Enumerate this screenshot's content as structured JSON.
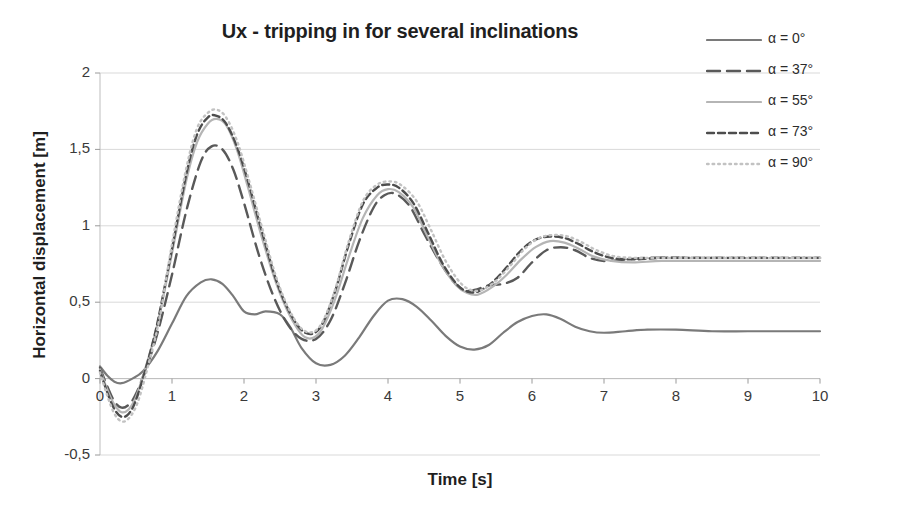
{
  "chart_data": {
    "type": "line",
    "title": "Ux - tripping in for several inclinations",
    "xlabel": "Time [s]",
    "ylabel": "Horizontal displacement [m]",
    "xlim": [
      0,
      10
    ],
    "ylim": [
      -0.5,
      2
    ],
    "xticks": [
      "0",
      "1",
      "2",
      "3",
      "4",
      "5",
      "6",
      "7",
      "8",
      "9",
      "10"
    ],
    "xtick_values": [
      0,
      1,
      2,
      3,
      4,
      5,
      6,
      7,
      8,
      9,
      10
    ],
    "yticks": [
      "-0,5",
      "0",
      "0,5",
      "1",
      "1,5",
      "2"
    ],
    "ytick_values": [
      -0.5,
      0,
      0.5,
      1,
      1.5,
      2
    ],
    "grid": "horizontal",
    "legend_position": "right",
    "decimal_separator": ",",
    "series": [
      {
        "name": "α = 0°",
        "style": "solid",
        "color": "#7a7a7a",
        "width": 2.2,
        "dash": "none",
        "x": [
          0,
          0.1,
          0.2,
          0.3,
          0.45,
          0.6,
          0.8,
          1.0,
          1.2,
          1.4,
          1.55,
          1.7,
          1.85,
          2.0,
          2.15,
          2.3,
          2.5,
          2.65,
          2.8,
          3.0,
          3.2,
          3.4,
          3.6,
          3.8,
          4.0,
          4.2,
          4.4,
          4.6,
          4.8,
          5.0,
          5.2,
          5.4,
          5.6,
          5.8,
          6.0,
          6.2,
          6.4,
          6.6,
          6.8,
          7.0,
          7.3,
          7.6,
          8.0,
          8.5,
          9.0,
          9.5,
          10
        ],
        "y": [
          0.08,
          0.02,
          -0.02,
          -0.03,
          0.0,
          0.05,
          0.18,
          0.36,
          0.54,
          0.63,
          0.65,
          0.62,
          0.54,
          0.44,
          0.42,
          0.44,
          0.42,
          0.33,
          0.2,
          0.1,
          0.09,
          0.15,
          0.27,
          0.41,
          0.51,
          0.52,
          0.47,
          0.38,
          0.28,
          0.21,
          0.19,
          0.22,
          0.3,
          0.37,
          0.41,
          0.42,
          0.39,
          0.34,
          0.31,
          0.3,
          0.31,
          0.32,
          0.32,
          0.31,
          0.31,
          0.31,
          0.31
        ]
      },
      {
        "name": "α = 37°",
        "style": "long-dash",
        "color": "#595959",
        "width": 2.4,
        "dash": "13 7",
        "x": [
          0,
          0.1,
          0.2,
          0.3,
          0.4,
          0.5,
          0.65,
          0.8,
          1.0,
          1.2,
          1.4,
          1.55,
          1.7,
          1.85,
          2.0,
          2.2,
          2.4,
          2.6,
          2.8,
          3.0,
          3.2,
          3.4,
          3.6,
          3.8,
          3.95,
          4.1,
          4.3,
          4.5,
          4.7,
          4.9,
          5.05,
          5.2,
          5.4,
          5.6,
          5.8,
          6.0,
          6.2,
          6.4,
          6.6,
          6.8,
          7.0,
          7.3,
          7.6,
          8.0,
          8.5,
          9.0,
          9.5,
          10
        ],
        "y": [
          0.07,
          -0.05,
          -0.15,
          -0.19,
          -0.17,
          -0.1,
          0.08,
          0.3,
          0.68,
          1.1,
          1.42,
          1.52,
          1.5,
          1.37,
          1.15,
          0.82,
          0.55,
          0.36,
          0.26,
          0.26,
          0.38,
          0.62,
          0.9,
          1.12,
          1.2,
          1.21,
          1.13,
          0.95,
          0.78,
          0.64,
          0.58,
          0.58,
          0.61,
          0.62,
          0.66,
          0.76,
          0.84,
          0.86,
          0.84,
          0.79,
          0.77,
          0.78,
          0.79,
          0.79,
          0.79,
          0.79,
          0.79,
          0.79
        ]
      },
      {
        "name": "α = 55°",
        "style": "solid-light",
        "color": "#b5b5b5",
        "width": 2.2,
        "dash": "none",
        "x": [
          0,
          0.1,
          0.2,
          0.3,
          0.4,
          0.5,
          0.65,
          0.8,
          1.0,
          1.2,
          1.35,
          1.5,
          1.62,
          1.75,
          1.9,
          2.05,
          2.25,
          2.45,
          2.65,
          2.85,
          3.05,
          3.25,
          3.45,
          3.65,
          3.85,
          4.0,
          4.15,
          4.35,
          4.55,
          4.75,
          4.95,
          5.1,
          5.25,
          5.45,
          5.65,
          5.85,
          6.05,
          6.25,
          6.45,
          6.65,
          6.85,
          7.1,
          7.4,
          7.8,
          8.3,
          8.9,
          9.5,
          10
        ],
        "y": [
          0.06,
          -0.07,
          -0.17,
          -0.22,
          -0.2,
          -0.12,
          0.1,
          0.36,
          0.82,
          1.3,
          1.55,
          1.67,
          1.7,
          1.66,
          1.5,
          1.26,
          0.92,
          0.62,
          0.4,
          0.27,
          0.3,
          0.5,
          0.79,
          1.05,
          1.2,
          1.24,
          1.22,
          1.12,
          0.93,
          0.74,
          0.61,
          0.56,
          0.55,
          0.6,
          0.68,
          0.78,
          0.86,
          0.9,
          0.89,
          0.85,
          0.8,
          0.77,
          0.76,
          0.77,
          0.77,
          0.77,
          0.77,
          0.77
        ]
      },
      {
        "name": "α = 73°",
        "style": "short-dash",
        "color": "#4d4d4d",
        "width": 2.4,
        "dash": "7 4",
        "x": [
          0,
          0.1,
          0.2,
          0.3,
          0.4,
          0.5,
          0.65,
          0.8,
          1.0,
          1.2,
          1.35,
          1.5,
          1.62,
          1.75,
          1.9,
          2.05,
          2.25,
          2.45,
          2.65,
          2.85,
          3.05,
          3.25,
          3.45,
          3.65,
          3.85,
          4.0,
          4.15,
          4.35,
          4.55,
          4.75,
          4.95,
          5.1,
          5.25,
          5.45,
          5.65,
          5.85,
          6.05,
          6.25,
          6.45,
          6.65,
          6.85,
          7.1,
          7.4,
          7.8,
          8.3,
          8.9,
          9.5,
          10
        ],
        "y": [
          0.05,
          -0.09,
          -0.2,
          -0.25,
          -0.23,
          -0.14,
          0.09,
          0.37,
          0.85,
          1.34,
          1.6,
          1.71,
          1.72,
          1.67,
          1.52,
          1.3,
          0.96,
          0.64,
          0.42,
          0.3,
          0.33,
          0.55,
          0.87,
          1.14,
          1.25,
          1.27,
          1.25,
          1.15,
          0.96,
          0.76,
          0.62,
          0.57,
          0.57,
          0.63,
          0.73,
          0.84,
          0.91,
          0.93,
          0.92,
          0.88,
          0.83,
          0.79,
          0.78,
          0.79,
          0.79,
          0.79,
          0.79,
          0.79
        ]
      },
      {
        "name": "α = 90°",
        "style": "dotted",
        "color": "#c2c2c2",
        "width": 2.4,
        "dash": "1.6 4",
        "x": [
          0,
          0.1,
          0.2,
          0.3,
          0.4,
          0.52,
          0.66,
          0.82,
          1.0,
          1.2,
          1.35,
          1.5,
          1.62,
          1.75,
          1.9,
          2.05,
          2.25,
          2.45,
          2.65,
          2.85,
          3.05,
          3.25,
          3.45,
          3.65,
          3.85,
          4.05,
          4.2,
          4.4,
          4.6,
          4.8,
          5.0,
          5.15,
          5.3,
          5.5,
          5.7,
          5.9,
          6.1,
          6.3,
          6.5,
          6.7,
          6.9,
          7.15,
          7.45,
          7.85,
          8.35,
          8.9,
          9.5,
          10
        ],
        "y": [
          0.04,
          -0.11,
          -0.23,
          -0.28,
          -0.26,
          -0.16,
          0.07,
          0.38,
          0.88,
          1.38,
          1.64,
          1.74,
          1.76,
          1.71,
          1.56,
          1.33,
          0.99,
          0.66,
          0.43,
          0.31,
          0.34,
          0.56,
          0.89,
          1.16,
          1.27,
          1.29,
          1.26,
          1.16,
          0.97,
          0.77,
          0.63,
          0.58,
          0.58,
          0.64,
          0.74,
          0.85,
          0.92,
          0.94,
          0.93,
          0.89,
          0.84,
          0.8,
          0.79,
          0.79,
          0.79,
          0.79,
          0.79,
          0.79
        ]
      }
    ]
  },
  "axes": {
    "title": "Ux - tripping in for several inclinations",
    "ylabel": "Horizontal displacement [m]",
    "xlabel": "Time [s]"
  },
  "legend": {
    "items": [
      {
        "label": "α = 0°"
      },
      {
        "label": "α = 37°"
      },
      {
        "label": "α = 55°"
      },
      {
        "label": "α = 73°"
      },
      {
        "label": "α = 90°"
      }
    ]
  }
}
